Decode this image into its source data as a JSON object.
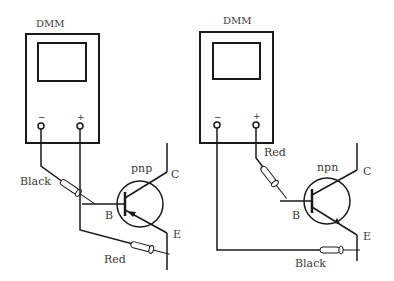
{
  "diagram": {
    "type": "circuit",
    "left": {
      "meter_label": "DMM",
      "terminal_minus": "−",
      "terminal_plus": "+",
      "transistor_type": "pnp",
      "pins": {
        "base": "B",
        "collector": "C",
        "emitter": "E"
      },
      "probe_base": "Black",
      "probe_emitter": "Red"
    },
    "right": {
      "meter_label": "DMM",
      "terminal_minus": "−",
      "terminal_plus": "+",
      "transistor_type": "npn",
      "pins": {
        "base": "B",
        "collector": "C",
        "emitter": "E"
      },
      "probe_base": "Red",
      "probe_emitter": "Black"
    },
    "colors": {
      "line": "#1a1a1a",
      "text": "#3a3a3a",
      "background": "#ffffff"
    }
  }
}
